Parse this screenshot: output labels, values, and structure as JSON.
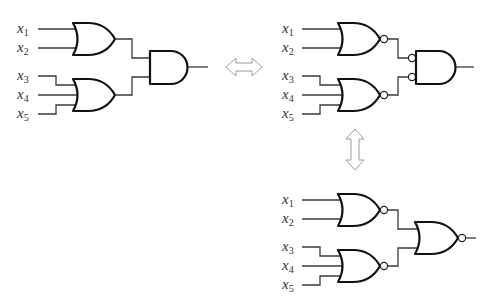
{
  "diagram": {
    "colors": {
      "wire": "#3a3a3a",
      "gate": "#111111",
      "arrow": "#9a9a9a",
      "background": "#ffffff"
    },
    "circuits": [
      {
        "name": "or-and",
        "inputs": [
          {
            "var": "x",
            "sub": "1"
          },
          {
            "var": "x",
            "sub": "2"
          },
          {
            "var": "x",
            "sub": "3"
          },
          {
            "var": "x",
            "sub": "4"
          },
          {
            "var": "x",
            "sub": "5"
          }
        ],
        "gates": [
          "OR(x1,x2)",
          "OR(x3,x4,x5)",
          "AND"
        ]
      },
      {
        "name": "nor-and-inverted-inputs",
        "inputs": [
          {
            "var": "x",
            "sub": "1"
          },
          {
            "var": "x",
            "sub": "2"
          },
          {
            "var": "x",
            "sub": "3"
          },
          {
            "var": "x",
            "sub": "4"
          },
          {
            "var": "x",
            "sub": "5"
          }
        ],
        "gates": [
          "NOR(x1,x2)",
          "NOR(x3,x4,x5)",
          "AND with inverted inputs"
        ]
      },
      {
        "name": "nor-nor",
        "inputs": [
          {
            "var": "x",
            "sub": "1"
          },
          {
            "var": "x",
            "sub": "2"
          },
          {
            "var": "x",
            "sub": "3"
          },
          {
            "var": "x",
            "sub": "4"
          },
          {
            "var": "x",
            "sub": "5"
          }
        ],
        "gates": [
          "NOR(x1,x2)",
          "NOR(x3,x4,x5)",
          "NOR"
        ]
      }
    ],
    "arrows": [
      {
        "name": "horizontal-double-arrow",
        "between": [
          "or-and",
          "nor-and-inverted-inputs"
        ]
      },
      {
        "name": "vertical-double-arrow",
        "between": [
          "nor-and-inverted-inputs",
          "nor-nor"
        ]
      }
    ]
  }
}
